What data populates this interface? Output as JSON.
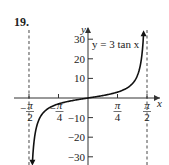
{
  "problem_number": "19.",
  "chart_data": {
    "type": "line",
    "title": "",
    "annotation": "y = 3 tan x",
    "xlabel": "x",
    "ylabel": "y",
    "function": "3*tan(x)",
    "xlim": [
      -1.5708,
      1.5708
    ],
    "ylim": [
      -33,
      33
    ],
    "asymptotes": [
      -1.5708,
      1.5708
    ],
    "x_ticks": [
      {
        "value": -1.5708,
        "label_num": "π",
        "label_den": "2",
        "sign": "−"
      },
      {
        "value": -0.7854,
        "label_num": "π",
        "label_den": "4",
        "sign": "−"
      },
      {
        "value": 0.7854,
        "label_num": "π",
        "label_den": "4",
        "sign": ""
      },
      {
        "value": 1.5708,
        "label_num": "π",
        "label_den": "2",
        "sign": ""
      }
    ],
    "y_ticks": [
      {
        "value": 30,
        "label": "30"
      },
      {
        "value": 20,
        "label": "20"
      },
      {
        "value": 10,
        "label": "10"
      },
      {
        "value": -10,
        "label": "−10"
      },
      {
        "value": -20,
        "label": "−20"
      },
      {
        "value": -30,
        "label": "−30"
      }
    ],
    "grid": false
  }
}
